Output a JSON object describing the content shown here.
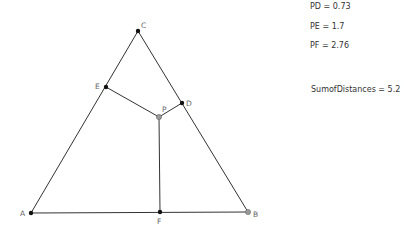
{
  "diagram": {
    "points": {
      "A": {
        "label": "A",
        "x": 31,
        "y": 213
      },
      "B": {
        "label": "B",
        "x": 248,
        "y": 212
      },
      "C": {
        "label": "C",
        "x": 138,
        "y": 31
      },
      "D": {
        "label": "D",
        "x": 182,
        "y": 103
      },
      "E": {
        "label": "E",
        "x": 106,
        "y": 87
      },
      "F": {
        "label": "F",
        "x": 160,
        "y": 212
      },
      "P": {
        "label": "P",
        "x": 159,
        "y": 117
      }
    }
  },
  "measurements": {
    "pd": "PD = 0.73",
    "pe": "PE = 1.7",
    "pf": "PF = 2.76",
    "sum": "SumofDistances = 5.2"
  }
}
